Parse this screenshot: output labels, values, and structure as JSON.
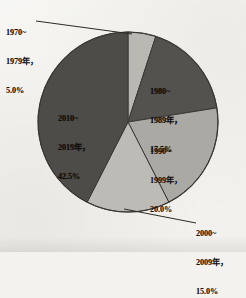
{
  "chart_data": {
    "type": "pie",
    "title": "",
    "subtitle": "",
    "xlabel": "",
    "ylabel": "",
    "legend_position": "none",
    "grid": false,
    "units": "percent",
    "start_angle_deg": 0,
    "direction": "clockwise",
    "categories": [
      "1970~1979年",
      "1980~1989年",
      "1990~1999年",
      "2000~2009年",
      "2010~2019年"
    ],
    "values": [
      5.0,
      17.5,
      20.0,
      15.0,
      42.5
    ],
    "value_labels": [
      "5.0%",
      "17.5%",
      "20.0%",
      "15.0%",
      "42.5%"
    ],
    "slices": [
      {
        "id": "slice-1970-1979",
        "period": "1970~1979年",
        "percent": 5.0,
        "percent_text": "5.0%",
        "label_line_1": "1970~",
        "label_line_2": "1979年，",
        "label_line_3": "5.0%",
        "color": "#b9b8b3",
        "label_placement": "outside-leader",
        "start_angle_deg": 0.0,
        "end_angle_deg": 18.0
      },
      {
        "id": "slice-1980-1989",
        "period": "1980~1989年",
        "percent": 17.5,
        "percent_text": "17.5%",
        "label_line_1": "1980~",
        "label_line_2": "1989年，",
        "label_line_3": "17.5%",
        "color": "#54524f",
        "label_placement": "inside",
        "start_angle_deg": 18.0,
        "end_angle_deg": 81.0
      },
      {
        "id": "slice-1990-1999",
        "period": "1990~1999年",
        "percent": 20.0,
        "percent_text": "20.0%",
        "label_line_1": "1990~",
        "label_line_2": "1999年，",
        "label_line_3": "20.0%",
        "color": "#aaa9a4",
        "label_placement": "inside",
        "start_angle_deg": 81.0,
        "end_angle_deg": 153.0
      },
      {
        "id": "slice-2000-2009",
        "period": "2000~2009年",
        "percent": 15.0,
        "percent_text": "15.0%",
        "label_line_1": "2000~",
        "label_line_2": "2009年，",
        "label_line_3": "15.0%",
        "color": "#bcbbb6",
        "label_placement": "outside-leader",
        "start_angle_deg": 153.0,
        "end_angle_deg": 207.0
      },
      {
        "id": "slice-2010-2019",
        "period": "2010~2019年",
        "percent": 42.5,
        "percent_text": "42.5%",
        "label_line_1": "2010~",
        "label_line_2": "2019年，",
        "label_line_3": "42.5%",
        "color": "#4e4c49",
        "label_placement": "inside",
        "start_angle_deg": 207.0,
        "end_angle_deg": 360.0
      }
    ],
    "colors": {
      "background": "#f2f1ed",
      "outline": "#3a3836",
      "leader_line": "#2b2a27",
      "text": "#15130f"
    }
  }
}
